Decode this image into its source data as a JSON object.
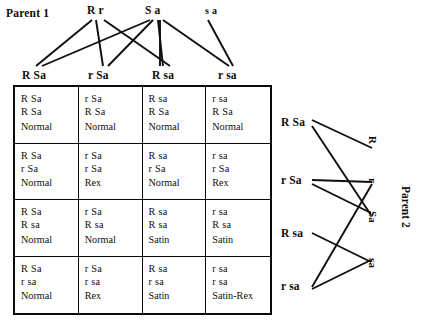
{
  "diagram": {
    "title_parent1": "Parent 1",
    "title_parent2": "Parent 2",
    "parent1_alleles": [
      {
        "a1": "R",
        "a2": "r"
      },
      {
        "a1": "S",
        "a2": "a"
      },
      {
        "a1": "s",
        "a2": "a"
      }
    ],
    "parent1_gametes": [
      "R Sa",
      "r Sa",
      "R sa",
      "r sa"
    ],
    "parent2_gametes": [
      "R Sa",
      "r Sa",
      "R sa",
      "r sa"
    ],
    "parent2_alleles": [
      "R",
      "r",
      "Sa",
      "sa"
    ],
    "grid": {
      "rows": [
        [
          {
            "allele_top": "R Sa",
            "allele_bottom": "R Sa",
            "phenotype": "Normal"
          },
          {
            "allele_top": "r Sa",
            "allele_bottom": "R Sa",
            "phenotype": "Normal"
          },
          {
            "allele_top": "R sa",
            "allele_bottom": "R Sa",
            "phenotype": "Normal"
          },
          {
            "allele_top": "r sa",
            "allele_bottom": "R Sa",
            "phenotype": "Normal"
          }
        ],
        [
          {
            "allele_top": "R Sa",
            "allele_bottom": "r Sa",
            "phenotype": "Normal"
          },
          {
            "allele_top": "r Sa",
            "allele_bottom": "r Sa",
            "phenotype": "Rex"
          },
          {
            "allele_top": "R sa",
            "allele_bottom": "r Sa",
            "phenotype": "Normal"
          },
          {
            "allele_top": "r sa",
            "allele_bottom": "r Sa",
            "phenotype": "Rex"
          }
        ],
        [
          {
            "allele_top": "R Sa",
            "allele_bottom": "R sa",
            "phenotype": "Normal"
          },
          {
            "allele_top": "r Sa",
            "allele_bottom": "R sa",
            "phenotype": "Normal"
          },
          {
            "allele_top": "R sa",
            "allele_bottom": "R sa",
            "phenotype": "Satin"
          },
          {
            "allele_top": "r sa",
            "allele_bottom": "R sa",
            "phenotype": "Satin"
          }
        ],
        [
          {
            "allele_top": "R Sa",
            "allele_bottom": "r sa",
            "phenotype": "Normal"
          },
          {
            "allele_top": "r Sa",
            "allele_bottom": "r sa",
            "phenotype": "Rex"
          },
          {
            "allele_top": "R sa",
            "allele_bottom": "r sa",
            "phenotype": "Satin"
          },
          {
            "allele_top": "r sa",
            "allele_bottom": "r sa",
            "phenotype": "Satin-Rex"
          }
        ]
      ]
    },
    "colors": {
      "ink": "#100d0a",
      "background": "#ffffff"
    }
  }
}
